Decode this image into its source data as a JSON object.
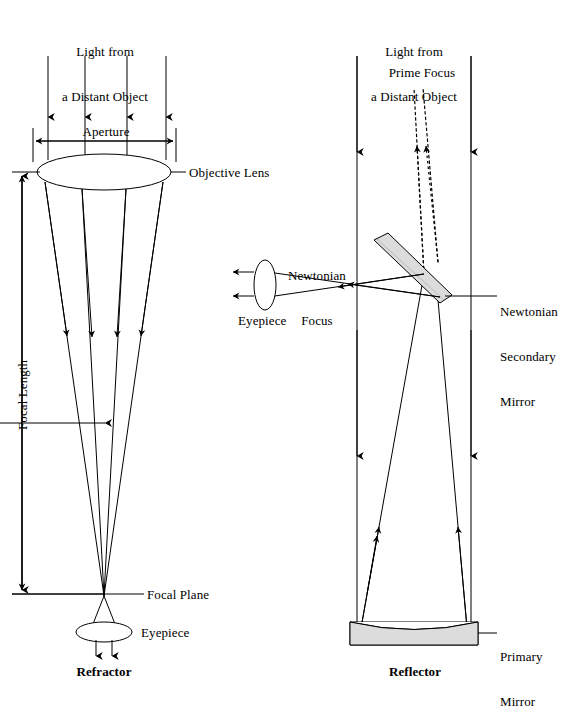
{
  "figure": {
    "background_color": "#ffffff",
    "line_color": "#000000",
    "mirror_fill_color": "#d9d9d9"
  },
  "refractor": {
    "name": "Refractor",
    "caption": "Refractor",
    "source_label_line1": "Light from",
    "source_label_line2": "a Distant Object",
    "aperture_label": "Aperture",
    "objective_lens_label": "Objective Lens",
    "focal_length_label": "Focal Length",
    "focal_plane_label": "Focal Plane",
    "eyepiece_label": "Eyepiece",
    "incoming_ray_count": 4,
    "converging_ray_count": 4,
    "exit_ray_count": 2
  },
  "reflector": {
    "name": "Reflector",
    "caption": "Reflector",
    "source_label_line1": "Light from",
    "source_label_line2": "a Distant Object",
    "prime_focus_label": "Prime Focus",
    "newtonian_focus_label_line1": "Newtonian",
    "newtonian_focus_label_line2": "Focus",
    "eyepiece_label": "Eyepiece",
    "secondary_mirror_label_line1": "Newtonian",
    "secondary_mirror_label_line2": "Secondary",
    "secondary_mirror_label_line3": "Mirror",
    "primary_mirror_label_line1": "Primary",
    "primary_mirror_label_line2": "Mirror",
    "incoming_ray_count": 2,
    "reflected_ray_count": 2,
    "prime_focus_ray_count": 2,
    "exit_ray_count": 2
  }
}
